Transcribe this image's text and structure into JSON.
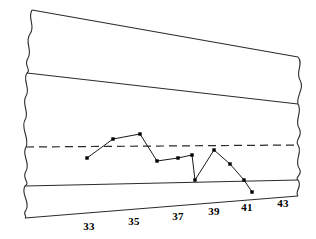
{
  "chart_data": {
    "type": "line",
    "title": "",
    "subtitle": "",
    "xlabel": "",
    "ylabel": "",
    "grid": false,
    "legend": "none",
    "axis_break": "both-ends-wavy",
    "xlim": [
      32,
      44
    ],
    "x_tick_labels": [
      "33",
      "35",
      "37",
      "39",
      "41",
      "43"
    ],
    "x_tick_values": [
      33,
      35,
      37,
      39,
      41,
      43
    ],
    "y_tick_labels": [],
    "series": [
      {
        "name": "observations",
        "marker": "filled-square",
        "color": "#000000",
        "x": [
          33.0,
          33.9,
          34.8,
          35.4,
          36.1,
          36.6,
          36.7,
          37.4,
          37.9,
          38.5,
          39.0
        ],
        "values": [
          158,
          139,
          134,
          161,
          158,
          155,
          180,
          150,
          164,
          180,
          192
        ],
        "points_px": [
          [
            87,
            158
          ],
          [
            113,
            139
          ],
          [
            140,
            134
          ],
          [
            157,
            161
          ],
          [
            178,
            158
          ],
          [
            192,
            155
          ],
          [
            195,
            180
          ],
          [
            214,
            150
          ],
          [
            230,
            164
          ],
          [
            244,
            180
          ],
          [
            252,
            192
          ]
        ]
      }
    ],
    "reference_lines": [
      {
        "name": "upper-boundary",
        "style": "solid",
        "label": "",
        "from_px": [
          32,
          10
        ],
        "to_px": [
          298,
          57
        ]
      },
      {
        "name": "upper-control-limit",
        "style": "solid",
        "label": "",
        "from_px": [
          27,
          73
        ],
        "to_px": [
          298,
          104
        ]
      },
      {
        "name": "center-line",
        "style": "dashed",
        "label": "",
        "from_px": [
          26,
          147
        ],
        "to_px": [
          298,
          145
        ]
      },
      {
        "name": "lower-control-limit",
        "style": "solid",
        "label": "",
        "from_px": [
          25,
          186
        ],
        "to_px": [
          298,
          180
        ]
      },
      {
        "name": "baseline-axis",
        "style": "solid",
        "label": "",
        "from_px": [
          25,
          218
        ],
        "to_px": [
          298,
          196
        ]
      }
    ]
  },
  "axis": {
    "ticks": [
      {
        "label": "33",
        "x": 89,
        "y": 230
      },
      {
        "label": "35",
        "x": 134,
        "y": 225
      },
      {
        "label": "37",
        "x": 178,
        "y": 220
      },
      {
        "label": "39",
        "x": 214,
        "y": 215
      },
      {
        "label": "41",
        "x": 247,
        "y": 211
      },
      {
        "label": "43",
        "x": 283,
        "y": 207
      }
    ]
  },
  "colors": {
    "ink": "#1a1a1a",
    "line": "#2b2b2b",
    "background": "#ffffff"
  }
}
